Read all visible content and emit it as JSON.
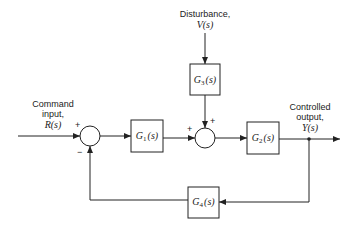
{
  "labels": {
    "command_input": [
      "Command",
      "input,",
      "R(s)"
    ],
    "disturbance": [
      "Disturbance,",
      "V(s)"
    ],
    "controlled_output": [
      "Controlled",
      "output,",
      "Y(s)"
    ]
  },
  "blocks": [
    {
      "id": "G1",
      "main": "G",
      "sub": "1",
      "arg": "(s)"
    },
    {
      "id": "G2",
      "main": "G",
      "sub": "2",
      "arg": "(s)"
    },
    {
      "id": "G3",
      "main": "G",
      "sub": "3",
      "arg": "(s)"
    },
    {
      "id": "G4",
      "main": "G",
      "sub": "4",
      "arg": "(s)"
    }
  ],
  "summing_junctions": [
    {
      "id": "sum1",
      "signs": {
        "input": "+",
        "feedback": "−"
      }
    },
    {
      "id": "sum2",
      "signs": {
        "left": "+",
        "top": "+"
      }
    }
  ],
  "colors": {
    "stroke": "#222222",
    "background": "#ffffff"
  }
}
